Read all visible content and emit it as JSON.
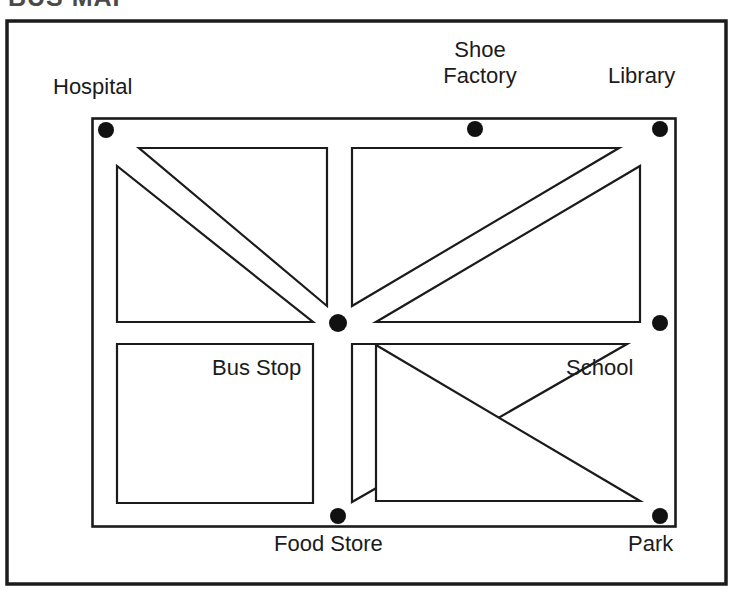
{
  "heading": {
    "text": "BUS MAP",
    "note": "cropped at top edge"
  },
  "map": {
    "title": "City street map with bus stops",
    "frame": {
      "x": 6,
      "y": 20,
      "width": 721,
      "height": 565
    },
    "area": {
      "x": 92,
      "y": 118,
      "width": 584,
      "height": 409
    },
    "center": {
      "x": 338,
      "y": 323
    },
    "colors": {
      "background": "#ffffff",
      "line": "#1b1b1b",
      "stop_dot": "#111111"
    },
    "labels": [
      {
        "name": "hospital",
        "text": "Hospital",
        "x": 53,
        "y": 74,
        "width": 120,
        "align": "left"
      },
      {
        "name": "shoe-factory",
        "text": "Shoe",
        "x": 420,
        "y": 37,
        "width": 120,
        "align": "center"
      },
      {
        "name": "shoe-factory-line2",
        "text": "Factory",
        "x": 420,
        "y": 63,
        "width": 120,
        "align": "center"
      },
      {
        "name": "library",
        "text": "Library",
        "x": 608,
        "y": 63,
        "width": 100,
        "align": "left"
      },
      {
        "name": "bus-stop",
        "text": "Bus Stop",
        "x": 212,
        "y": 355,
        "width": 120,
        "align": "left"
      },
      {
        "name": "school",
        "text": "School",
        "x": 566,
        "y": 355,
        "width": 100,
        "align": "left"
      },
      {
        "name": "food-store",
        "text": "Food Store",
        "x": 274,
        "y": 531,
        "width": 140,
        "align": "left"
      },
      {
        "name": "park",
        "text": "Park",
        "x": 628,
        "y": 531,
        "width": 70,
        "align": "left"
      }
    ],
    "stops": [
      {
        "name": "hospital",
        "label": "Hospital",
        "x": 106,
        "y": 130,
        "r": 8
      },
      {
        "name": "shoe-factory",
        "label": "Shoe Factory",
        "x": 475,
        "y": 129,
        "r": 8
      },
      {
        "name": "library",
        "label": "Library",
        "x": 660,
        "y": 129,
        "r": 8
      },
      {
        "name": "school",
        "label": "School",
        "x": 660,
        "y": 323,
        "r": 8
      },
      {
        "name": "park",
        "label": "Park",
        "x": 660,
        "y": 516,
        "r": 8
      },
      {
        "name": "food-store",
        "label": "Food Store",
        "x": 338,
        "y": 516,
        "r": 8
      },
      {
        "name": "bus-stop",
        "label": "Bus Stop",
        "x": 338,
        "y": 323,
        "r": 9
      }
    ],
    "blocks": [
      {
        "name": "block-top-left-upper",
        "points": "139,148 327,148 327,306"
      },
      {
        "name": "block-top-left-lower",
        "points": "117,166 117,322 313,322"
      },
      {
        "name": "block-top-right-lower",
        "points": "352,148 352,307 620,148"
      },
      {
        "name": "block-top-right-upper",
        "points": "640,165 640,322 375,322"
      },
      {
        "name": "block-bottom-left",
        "points": "117,344 313,344 313,503 117,503"
      },
      {
        "name": "block-bottom-right-upper",
        "points": "352,344 627,344 352,502"
      },
      {
        "name": "block-bottom-right-lower",
        "points": "375,344 640,501 375,501"
      }
    ],
    "roads": [
      {
        "name": "road-vertical-main",
        "kind": "vertical"
      },
      {
        "name": "road-horizontal-main",
        "kind": "horizontal"
      },
      {
        "name": "road-diagonal-hospital-to-center",
        "kind": "diagonal"
      },
      {
        "name": "road-diagonal-library-to-center",
        "kind": "diagonal"
      },
      {
        "name": "road-diagonal-center-to-park",
        "kind": "diagonal"
      }
    ]
  }
}
